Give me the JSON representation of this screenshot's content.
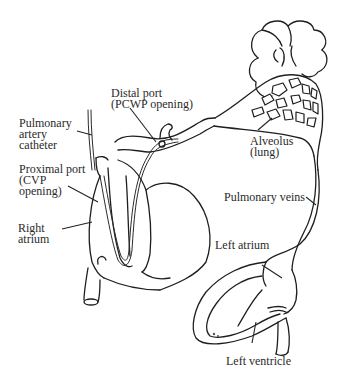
{
  "diagram": {
    "colors": {
      "line": "#1e1e1e",
      "text": "#2a2a2a",
      "background": "#ffffff"
    },
    "labels": {
      "distal_port": {
        "line1": "Distal port",
        "line2": "(PCWP opening)"
      },
      "pulmonary_artery_catheter": {
        "line1": "Pulmonary",
        "line2": "artery",
        "line3": "catheter"
      },
      "proximal_port": {
        "line1": "Proximal port",
        "line2": "(CVP",
        "line3": "opening)"
      },
      "right_atrium": {
        "line1": "Right",
        "line2": "atrium"
      },
      "alveolus": {
        "line1": "Alveolus",
        "line2": "(lung)"
      },
      "pulmonary_veins": {
        "line1": "Pulmonary veins"
      },
      "left_atrium": {
        "line1": "Left atrium"
      },
      "left_ventricle": {
        "line1": "Left ventricle"
      }
    }
  }
}
